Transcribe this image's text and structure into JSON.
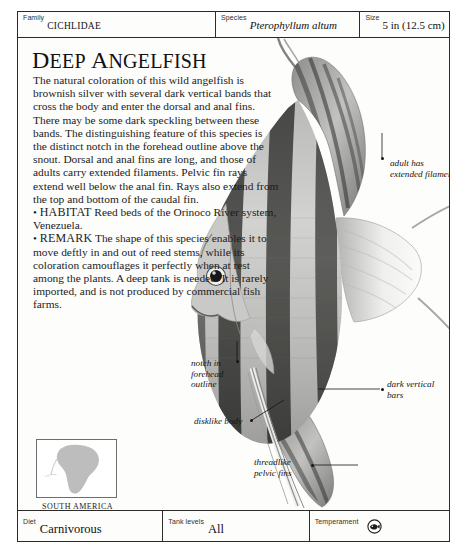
{
  "header": {
    "fields": [
      {
        "label": "Family",
        "value": "CICHLIDAE",
        "style": "smallcaps"
      },
      {
        "label": "Species",
        "value": "Pterophyllum altum",
        "style": "italic"
      },
      {
        "label": "Size",
        "value": "5 in (12.5 cm)",
        "style": "plain"
      }
    ]
  },
  "title": {
    "full": "DEEP ANGELFISH",
    "word1_cap": "D",
    "word1_rest": "EEP",
    "word2_cap": "A",
    "word2_rest": "NGELFISH"
  },
  "article": {
    "description": "The natural coloration of this wild angelfish is brownish silver with several dark vertical bands that cross the body and enter the dorsal and anal fins. There may be some dark speckling between these bands. The distinguishing feature of this species is the distinct notch in the forehead outline above the snout. Dorsal and anal fins are long, and those of adults carry extended filaments. Pelvic fin rays extend well below the anal fin. Rays also extend from the top and bottom of the caudal fin.",
    "habitat_label": "HABITAT",
    "habitat_text": "Reed beds of the Orinoco River system, Venezuela.",
    "remark_label": "REMARK",
    "remark_text": "The shape of this species enables it to move deftly in and out of reed stems, while its coloration camouflages it perfectly when at rest among the plants. A deep tank is needed. It is rarely imported, and is not produced by commercial fish farms.",
    "bullet": "•"
  },
  "callouts": [
    {
      "id": "filaments",
      "line1": "adult has",
      "line2": "extended filaments"
    },
    {
      "id": "notch",
      "line1": "notch in",
      "line2": "forehead",
      "line3": "outline"
    },
    {
      "id": "bars",
      "line1": "dark vertical",
      "line2": "bars"
    },
    {
      "id": "disk",
      "line1": "disklike body"
    },
    {
      "id": "pelvic",
      "line1": "threadlike",
      "line2": "pelvic fins"
    }
  ],
  "map": {
    "caption": "SOUTH AMERICA",
    "land_color": "#bdbdbd",
    "frame_color": "#6e6e6e"
  },
  "footer": {
    "fields": [
      {
        "label": "Diet",
        "value": "Carnivorous"
      },
      {
        "label": "Tank levels",
        "value": "All"
      },
      {
        "label": "Temperament",
        "value": "",
        "icon": "fish-temperament-icon"
      }
    ]
  },
  "photo": {
    "subject": "deep-angelfish-photograph",
    "alt": "Black and white photograph of a deep angelfish with tall dorsal and anal fins and dark vertical bars"
  },
  "colors": {
    "ink": "#1a1a1a",
    "rule": "#2b2b2b",
    "page": "#fdfdfc"
  }
}
